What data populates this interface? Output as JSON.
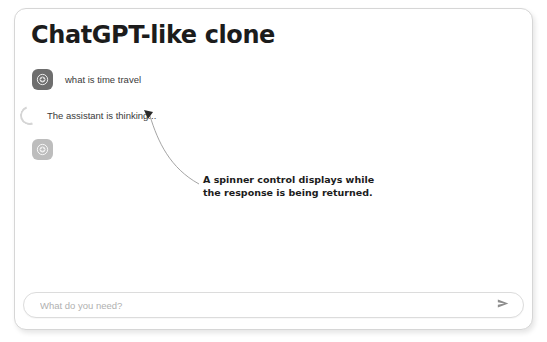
{
  "app": {
    "title": "ChatGPT-like clone"
  },
  "chat": {
    "messages": [
      {
        "role": "user",
        "avatar_icon": "user-avatar-icon",
        "text": "what is time travel"
      },
      {
        "role": "assistant",
        "avatar_icon": "assistant-avatar-icon",
        "text": ""
      }
    ],
    "status": {
      "spinner_icon": "loading-spinner-icon",
      "text": "The assistant is thinking..."
    }
  },
  "annotation": {
    "line1": "A spinner control displays while",
    "line2": "the response is being returned.",
    "pointer_icon": "arrowhead-icon"
  },
  "composer": {
    "placeholder": "What do you need?",
    "value": "",
    "send_icon": "send-arrow-icon"
  },
  "colors": {
    "card_border": "#d6d6d6",
    "title": "#1c1c1c",
    "user_avatar": "#6e6e6e",
    "assistant_avatar": "#bdbdbd",
    "spinner": "#d5d5d5",
    "placeholder": "#b0b0b0"
  }
}
